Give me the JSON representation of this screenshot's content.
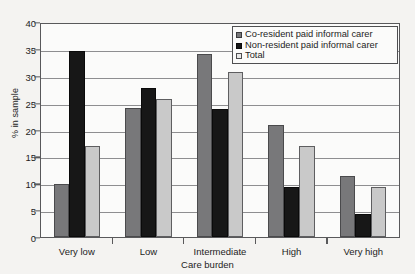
{
  "chart_data": {
    "type": "bar",
    "title": "",
    "xlabel": "Care burden",
    "ylabel": "% in sample",
    "categories": [
      "Very low",
      "Low",
      "Intermediate",
      "High",
      "Very high"
    ],
    "series": [
      {
        "name": "Co-resident paid informal carer",
        "color": "#78787a",
        "values": [
          10,
          24.3,
          34.3,
          21,
          11.5
        ]
      },
      {
        "name": "Non-resident paid informal carer",
        "color": "#171717",
        "values": [
          35,
          28,
          24,
          9.3,
          4.3
        ]
      },
      {
        "name": "Total",
        "color": "#c9c9c9",
        "values": [
          17,
          26,
          31,
          17,
          9.3
        ]
      }
    ],
    "ylim": [
      0,
      40
    ],
    "yticks": [
      0,
      5,
      10,
      15,
      20,
      25,
      30,
      35,
      40
    ],
    "ytick_labels": [
      "0",
      "5",
      "10",
      "15",
      "20",
      "25",
      "30",
      "35",
      "40"
    ],
    "grid": true,
    "legend_position": "top-right"
  }
}
